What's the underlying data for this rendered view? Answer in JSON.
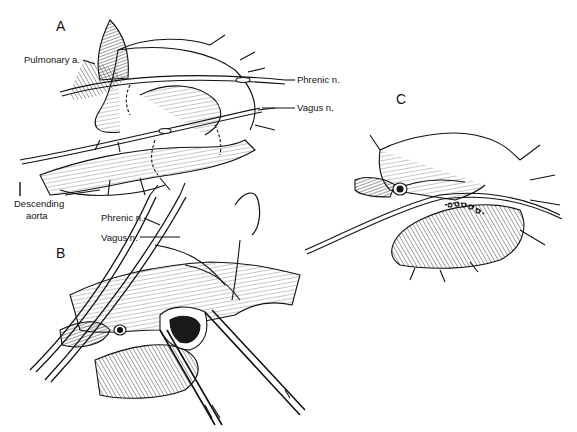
{
  "figure": {
    "panels": [
      {
        "id": "A",
        "letter": "A",
        "labels": {
          "pulmonary_artery": "Pulmonary a.",
          "phrenic_nerve": "Phrenic n.",
          "vagus_nerve": "Vagus n.",
          "descending_aorta_line1": "Descending",
          "descending_aorta_line2": "aorta"
        }
      },
      {
        "id": "B",
        "letter": "B",
        "labels": {
          "phrenic_nerve": "Phrenic n.",
          "vagus_nerve": "Vagus n."
        }
      },
      {
        "id": "C",
        "letter": "C",
        "labels": {}
      }
    ],
    "colors": {
      "ink": "#111111",
      "background": "#ffffff",
      "shade": "#555555",
      "lumen": "#1a1a1a"
    }
  }
}
